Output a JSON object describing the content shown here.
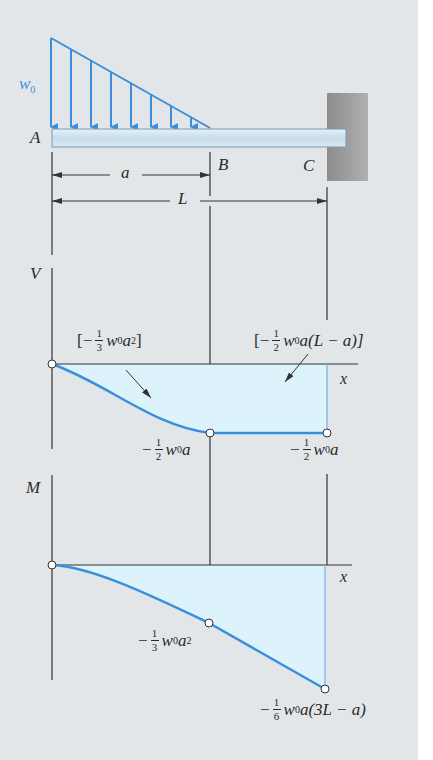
{
  "figure": {
    "colors": {
      "background": "#e3e6e9",
      "load_blue": "#3a8fdc",
      "beam_fill": "#cfe3f0",
      "wall_gray": "#9a9a9a",
      "area_fill": "#dcf3fb",
      "line_dark": "#333333"
    }
  },
  "beam": {
    "load_label_main": "w",
    "load_label_sub": "0",
    "point_a": "A",
    "point_b": "B",
    "point_c": "C",
    "dim_a": "a",
    "dim_l": "L"
  },
  "shear_diagram": {
    "axis_label": "V",
    "x_label": "x",
    "area1": {
      "open": "[−",
      "num": "1",
      "den": "3",
      "expr": "w",
      "sub": "0",
      "tail": "a",
      "sup": "2",
      "close": "]"
    },
    "area2": {
      "open": "[−",
      "num": "1",
      "den": "2",
      "expr": "w",
      "sub": "0",
      "tail": "a(L − a)]"
    },
    "value_b": {
      "sign": "−",
      "num": "1",
      "den": "2",
      "expr": "w",
      "sub": "0",
      "tail": "a"
    },
    "value_c": {
      "sign": "−",
      "num": "1",
      "den": "2",
      "expr": "w",
      "sub": "0",
      "tail": "a"
    }
  },
  "moment_diagram": {
    "axis_label": "M",
    "x_label": "x",
    "value_b": {
      "sign": "−",
      "num": "1",
      "den": "3",
      "expr": "w",
      "sub": "0",
      "tail": "a",
      "sup": "2"
    },
    "value_c": {
      "sign": "−",
      "num": "1",
      "den": "6",
      "expr": "w",
      "sub": "0",
      "tail": "a(3L − a)"
    }
  }
}
